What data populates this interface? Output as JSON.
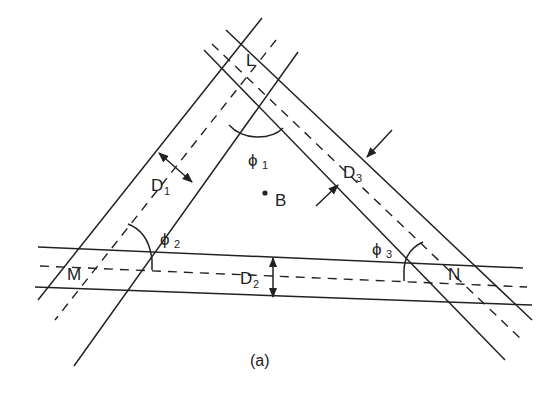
{
  "figure": {
    "caption": "(a)",
    "vertices": {
      "top": "L",
      "left": "M",
      "right": "N"
    },
    "center_point": "B",
    "angles": [
      {
        "symbol": "ϕ",
        "subscript": "1"
      },
      {
        "symbol": "ϕ",
        "subscript": "2"
      },
      {
        "symbol": "ϕ",
        "subscript": "3"
      }
    ],
    "widths": [
      {
        "symbol": "D",
        "subscript": "1"
      },
      {
        "symbol": "D",
        "subscript": "2"
      },
      {
        "symbol": "D",
        "subscript": "3"
      }
    ],
    "colors": {
      "stroke": "#222222",
      "background": "#ffffff"
    }
  }
}
